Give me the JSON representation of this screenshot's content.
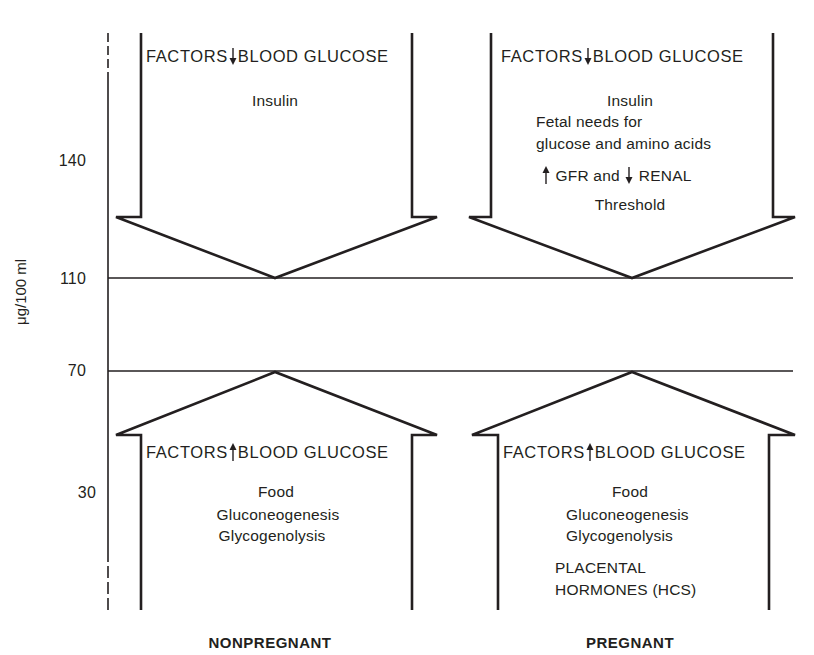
{
  "y_axis": {
    "label": "μg/100 ml",
    "ticks": [
      "140",
      "110",
      "70",
      "30"
    ]
  },
  "reference_lines": {
    "upper": "110",
    "lower": "70"
  },
  "panels": {
    "nonpregnant": {
      "caption": "NONPREGNANT",
      "down_arrow": {
        "header_left": "FACTORS",
        "header_right": "BLOOD GLUCOSE",
        "header_arrow": "down-arrow",
        "items": [
          "Insulin"
        ]
      },
      "up_arrow": {
        "header_left": "FACTORS",
        "header_right": "BLOOD GLUCOSE",
        "header_arrow": "up-arrow",
        "items": [
          "Food",
          "Gluconeogenesis",
          "Glycogenolysis"
        ]
      }
    },
    "pregnant": {
      "caption": "PREGNANT",
      "down_arrow": {
        "header_left": "FACTORS",
        "header_right": "BLOOD GLUCOSE",
        "header_arrow": "down-arrow",
        "items": [
          "Insulin",
          "Fetal needs for",
          "glucose and amino acids"
        ],
        "renal": {
          "part1": "GFR and",
          "part2": "RENAL",
          "part3": "Threshold"
        }
      },
      "up_arrow": {
        "header_left": "FACTORS",
        "header_right": "BLOOD GLUCOSE",
        "header_arrow": "up-arrow",
        "items": [
          "Food",
          "Gluconeogenesis",
          "Glycogenolysis"
        ],
        "extra": [
          "PLACENTAL",
          "HORMONES (HCS)"
        ]
      }
    }
  },
  "colors": {
    "ink": "#231f20",
    "background": "#ffffff"
  }
}
